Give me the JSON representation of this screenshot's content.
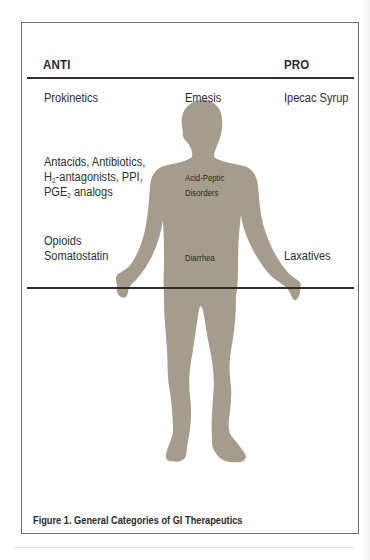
{
  "figure": {
    "caption": "Figure 1. General Categories of GI Therapeutics",
    "columns": {
      "anti_header": "ANTI",
      "pro_header": "PRO"
    },
    "rows": [
      {
        "anti": [
          "Prokinetics"
        ],
        "condition": [
          "Emesis"
        ],
        "pro": [
          "Ipecac Syrup"
        ]
      },
      {
        "anti": [
          "Antacids, Antibiotics,",
          "H2-antagonists, PPI,",
          "PGE2 analogs"
        ],
        "condition": [
          "Acid-Peptic",
          "Disorders"
        ],
        "pro": []
      },
      {
        "anti": [
          "Opioids",
          "Somatostatin"
        ],
        "condition": [
          "Diarrhea"
        ],
        "pro": [
          "Laxatives"
        ]
      }
    ],
    "anti_text": {
      "r1": "Prokinetics",
      "r2_l1": "Antacids, Antibiotics,",
      "r2_l2_pre": "H",
      "r2_l2_sub": "2",
      "r2_l2_post": "-antagonists, PPI,",
      "r2_l3_pre": "PGE",
      "r2_l3_sub": "2",
      "r2_l3_post": " analogs",
      "r3_l1": "Opioids",
      "r3_l2": "Somatostatin"
    },
    "condition_text": {
      "r1": "Emesis",
      "r2_l1": "Acid-Peptic",
      "r2_l2": "Disorders",
      "r3": "Diarrhea"
    },
    "pro_text": {
      "r1": "Ipecac Syrup",
      "r3": "Laxatives"
    },
    "silhouette": {
      "icon": "human-body-silhouette",
      "color": "#a49d8c"
    },
    "colors": {
      "rule": "#2d2d2d",
      "border": "#6e6e6e",
      "text": "#2e2e2e"
    }
  }
}
